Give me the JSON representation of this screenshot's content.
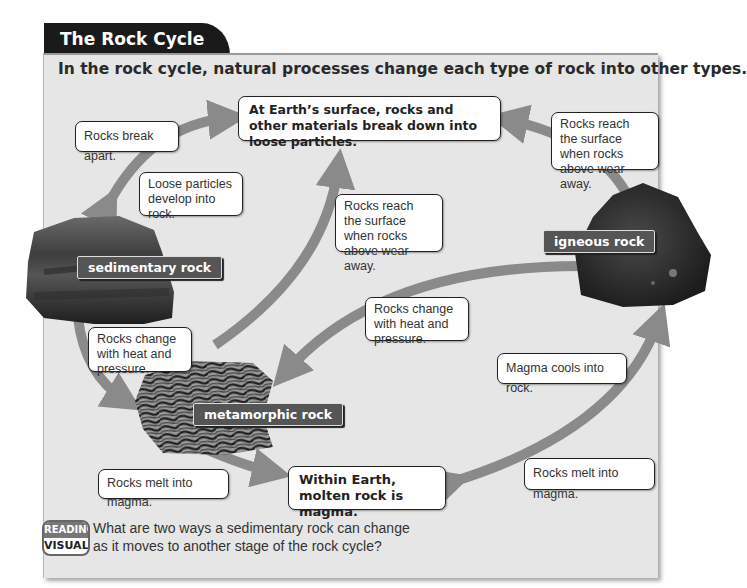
{
  "header": {
    "title": "The Rock Cycle",
    "subtitle": "In the rock cycle, natural processes change each type of rock into other types."
  },
  "rocks": {
    "sedimentary": "sedimentary rock",
    "metamorphic": "metamorphic rock",
    "igneous": "igneous rock"
  },
  "stages": {
    "surface": "At Earth’s surface, rocks and other materials break down into loose particles.",
    "magma": "Within Earth, molten rock is magma."
  },
  "callouts": {
    "break_apart": "Rocks break apart.",
    "loose_particles": "Loose particles develop into rock.",
    "reach_surface_igneous": "Rocks reach the surface when rocks above wear away.",
    "reach_surface_metamorphic": "Rocks reach the surface when rocks above wear away.",
    "change_heat_igneous": "Rocks change with heat and pressure.",
    "change_heat_sedimentary": "Rocks change with heat and pressure.",
    "magma_cools": "Magma cools into rock.",
    "melt_metamorphic": "Rocks melt into magma.",
    "melt_igneous": "Rocks melt into magma."
  },
  "reading_visuals": {
    "badge_top": "READING",
    "badge_bottom": "VISUALS",
    "question": "What are two ways a sedimentary rock can change as it moves to another stage of the rock cycle?"
  },
  "colors": {
    "panel_bg": "#e6e6e6",
    "tab_bg": "#1a1a1a",
    "arrow": "#8a8a8a",
    "label_bg": "#555555"
  }
}
